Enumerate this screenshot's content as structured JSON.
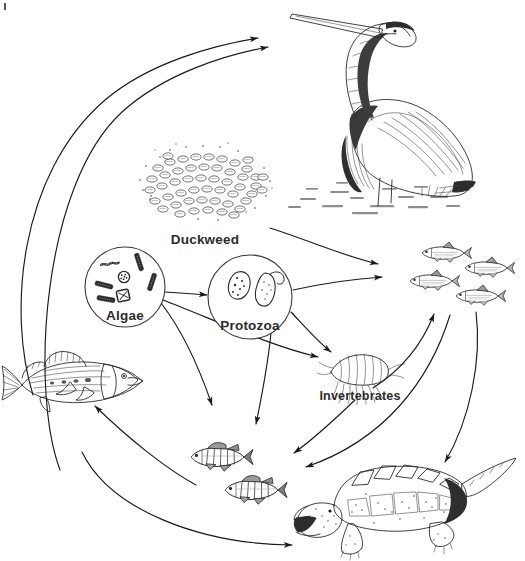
{
  "diagram": {
    "type": "food-web",
    "background_color": "#ffffff",
    "ink_color": "#2a2a2a",
    "label_color": "#2b2b2b"
  },
  "nodes": [
    {
      "id": "heron",
      "label": "",
      "icon": "heron-illustration",
      "description": "Great blue heron standing in shallow water, facing left",
      "x": 400,
      "y": 110
    },
    {
      "id": "duckweed",
      "label": "Duckweed",
      "icon": "duckweed-illustration",
      "description": "Dense floating mat of duckweed fronds",
      "x": 220,
      "y": 190
    },
    {
      "id": "algae",
      "label": "Algae",
      "icon": "algae-circle-illustration",
      "description": "Circle containing filamentous algae and diatoms",
      "x": 125,
      "y": 287
    },
    {
      "id": "protozoa",
      "label": "Protozoa",
      "icon": "protozoa-circle-illustration",
      "description": "Circle containing two single-celled protozoa",
      "x": 250,
      "y": 297
    },
    {
      "id": "minnows",
      "label": "",
      "icon": "minnow-school-illustration",
      "description": "School of four small minnows facing left",
      "x": 455,
      "y": 278
    },
    {
      "id": "invertebrates",
      "label": "Invertebrates",
      "icon": "amphipod-illustration",
      "description": "Freshwater amphipod / scud invertebrate",
      "x": 360,
      "y": 375
    },
    {
      "id": "gamefish",
      "label": "",
      "icon": "largemouth-bass-illustration",
      "description": "Large predatory game fish facing right",
      "x": 72,
      "y": 385
    },
    {
      "id": "perch",
      "label": "",
      "icon": "perch-pair-illustration",
      "description": "Two yellow perch with vertical bars, facing left",
      "x": 228,
      "y": 465
    },
    {
      "id": "turtle",
      "label": "",
      "icon": "snapping-turtle-illustration",
      "description": "Snapping turtle with open jaws facing left",
      "x": 400,
      "y": 505
    }
  ],
  "edges": [
    {
      "from": "gamefish",
      "to": "heron",
      "name": "gamefish-to-heron"
    },
    {
      "from": "perch",
      "to": "heron",
      "name": "perch-to-heron"
    },
    {
      "from": "duckweed",
      "to": "minnows",
      "name": "duckweed-to-minnows"
    },
    {
      "from": "algae",
      "to": "protozoa",
      "name": "algae-to-protozoa"
    },
    {
      "from": "algae",
      "to": "invertebrates",
      "name": "algae-to-invertebrates"
    },
    {
      "from": "algae",
      "to": "perch",
      "name": "algae-to-perch"
    },
    {
      "from": "protozoa",
      "to": "minnows",
      "name": "protozoa-to-minnows"
    },
    {
      "from": "protozoa",
      "to": "invertebrates",
      "name": "protozoa-to-invertebrates"
    },
    {
      "from": "protozoa",
      "to": "perch",
      "name": "protozoa-to-perch"
    },
    {
      "from": "invertebrates",
      "to": "minnows",
      "name": "invertebrates-to-minnows"
    },
    {
      "from": "invertebrates",
      "to": "perch",
      "name": "invertebrates-to-perch"
    },
    {
      "from": "minnows",
      "to": "turtle",
      "name": "minnows-to-turtle"
    },
    {
      "from": "minnows",
      "to": "perch",
      "name": "minnows-to-perch"
    },
    {
      "from": "perch",
      "to": "gamefish",
      "name": "perch-to-gamefish"
    },
    {
      "from": "gamefish",
      "to": "turtle",
      "name": "gamefish-to-turtle"
    }
  ],
  "labels": {
    "duckweed": "Duckweed",
    "algae": "Algae",
    "protozoa": "Protozoa",
    "invertebrates": "Invertebrates"
  }
}
